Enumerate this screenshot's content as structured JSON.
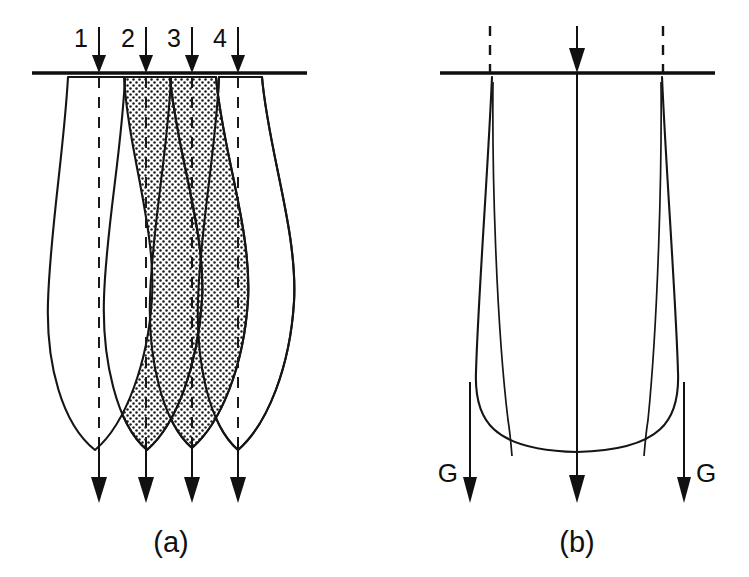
{
  "figure": {
    "background_color": "#ffffff",
    "line_color": "#151515",
    "shade_fill_color": "#d8d8d8",
    "width": 749,
    "height": 577
  },
  "panel_a": {
    "caption": "(a)",
    "top_labels": [
      {
        "text": "1"
      },
      {
        "text": "2"
      },
      {
        "text": "3"
      },
      {
        "text": "4"
      }
    ],
    "inflow_arrow_count": 4,
    "outflow_arrow_count": 4,
    "dashed_guide_count": 4,
    "lobe_count": 4,
    "shaded_lobe_labels": [
      "2",
      "3"
    ]
  },
  "panel_b": {
    "caption": "(b)",
    "side_labels": [
      {
        "text": "G"
      },
      {
        "text": "G"
      }
    ],
    "inflow_arrow_count": 1,
    "outflow_arrow_count": 3,
    "dashed_guide_count": 2,
    "lobe_count": 1
  }
}
